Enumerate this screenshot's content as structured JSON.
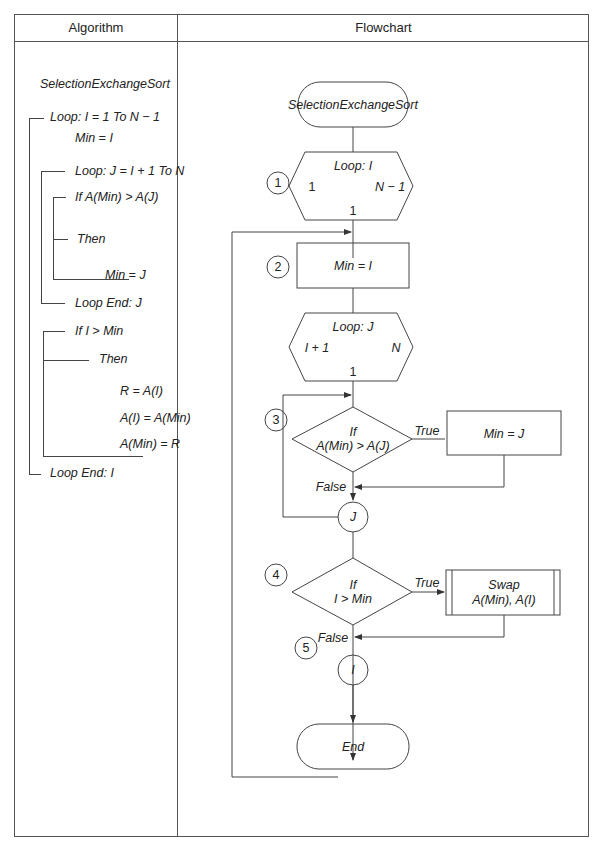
{
  "headers": {
    "algorithm": "Algorithm",
    "flowchart": "Flowchart"
  },
  "algorithm": {
    "title": "SelectionExchangeSort",
    "lines": [
      "Loop: I = 1 To N − 1",
      "Min = I",
      "Loop: J = I + 1 To N",
      "If A(Min) > A(J)",
      "Then",
      "Min = J",
      "Loop End: J",
      "If I > Min",
      "Then",
      "R = A(I)",
      "A(I) = A(Min)",
      "A(Min) = R",
      "Loop End: I"
    ]
  },
  "flowchart": {
    "start": "SelectionExchangeSort",
    "loop_i": {
      "label": "Loop: I",
      "start": "1",
      "end": "N − 1",
      "step": "1"
    },
    "assign_min": "Min = I",
    "loop_j": {
      "label": "Loop: J",
      "start": "I + 1",
      "end": "N",
      "step": "1"
    },
    "decision_1": {
      "line1": "If",
      "line2": "A(Min) > A(J)",
      "true": "True",
      "false": "False"
    },
    "assign_min_j": "Min = J",
    "connector_j": "J",
    "decision_2": {
      "line1": "If",
      "line2": "I > Min",
      "true": "True",
      "false": "False"
    },
    "swap": {
      "line1": "Swap",
      "line2": "A(Min), A(I)"
    },
    "connector_i": "I",
    "end": "End",
    "step_numbers": [
      "1",
      "2",
      "3",
      "4",
      "5"
    ]
  }
}
